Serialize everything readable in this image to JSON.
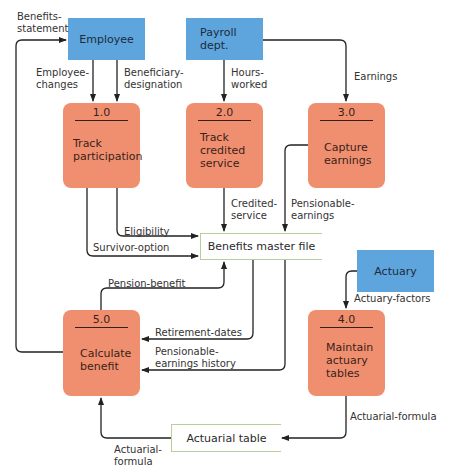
{
  "entities": {
    "employee": "Employee",
    "payroll_line1": "Payroll",
    "payroll_line2": "dept.",
    "actuary": "Actuary"
  },
  "processes": [
    {
      "num": "1.0",
      "lines": [
        "Track",
        "participation"
      ]
    },
    {
      "num": "2.0",
      "lines": [
        "Track",
        "credited",
        "service"
      ]
    },
    {
      "num": "3.0",
      "lines": [
        "Capture",
        "earnings"
      ]
    },
    {
      "num": "4.0",
      "lines": [
        "Maintain",
        "actuary",
        "tables"
      ]
    },
    {
      "num": "5.0",
      "lines": [
        "Calculate",
        "benefit"
      ]
    }
  ],
  "stores": {
    "benefits_master_file": "Benefits master file",
    "actuarial_table": "Actuarial table"
  },
  "flows": {
    "benefits_statement": [
      "Benefits-",
      "statement"
    ],
    "employee_changes": [
      "Employee-",
      "changes"
    ],
    "beneficiary_designation": [
      "Beneficiary-",
      "designation"
    ],
    "hours_worked": [
      "Hours-",
      "worked"
    ],
    "earnings": "Earnings",
    "credited_service": [
      "Credited-",
      "service"
    ],
    "pensionable_earnings": [
      "Pensionable-",
      "earnings"
    ],
    "eligibility": "Eligibility",
    "survivor_option": "Survivor-option",
    "pension_benefit": "Pension-benefit",
    "actuary_factors": "Actuary-factors",
    "retirement_dates": "Retirement-dates",
    "pensionable_earnings_history": [
      "Pensionable-",
      "earnings history"
    ],
    "actuarial_formula_right": "Actuarial-formula",
    "actuarial_formula_left": [
      "Actuarial-",
      "formula"
    ]
  },
  "colors": {
    "entity": "#5da5dc",
    "process": "#ef8f70",
    "store_border": "#b9cf9a",
    "line": "#222222"
  }
}
